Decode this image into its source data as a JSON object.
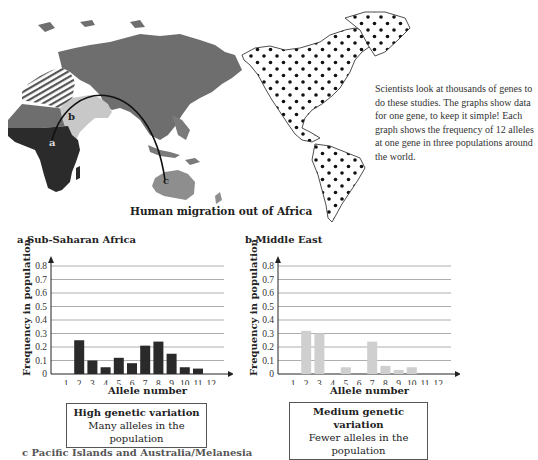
{
  "map": {
    "caption": "Human migration out of Africa",
    "labels": {
      "a": "a",
      "b": "b",
      "c": "c"
    },
    "colors": {
      "sub_saharan_africa": "#2b2b2b",
      "north_africa": "#6e6e6e",
      "middle_east": "#c8c8c8",
      "eurasia": "#6e6e6e",
      "australia": "#8e8e8e",
      "americas_fill": "#ffffff",
      "americas_dots": "#111111"
    }
  },
  "side_text": "Scientists look at thousands of genes to do these studies. The graphs show data for one gene, to keep it simple! Each graph shows the frequency of 12 alleles at one gene in three populations around the world.",
  "chart_data": [
    {
      "type": "bar",
      "title": "a Sub-Saharan Africa",
      "xlabel": "Allele number",
      "ylabel": "Frequency in population",
      "categories": [
        "1",
        "2",
        "3",
        "4",
        "5",
        "6",
        "7",
        "8",
        "9",
        "10",
        "11",
        "12"
      ],
      "values": [
        0,
        0.25,
        0.1,
        0.05,
        0.12,
        0.08,
        0.21,
        0.24,
        0.15,
        0.05,
        0.04,
        0
      ],
      "yticks": [
        "0",
        "0.1",
        "0.2",
        "0.3",
        "0.4",
        "0.5",
        "0.6",
        "0.7",
        "0.8"
      ],
      "ylim": [
        0,
        0.85
      ],
      "grid": true,
      "bar_color": "#2a2a2a"
    },
    {
      "type": "bar",
      "title": "b Middle East",
      "xlabel": "Allele number",
      "ylabel": "Frequency in population",
      "categories": [
        "1",
        "2",
        "3",
        "4",
        "5",
        "6",
        "7",
        "8",
        "9",
        "10",
        "11",
        "12"
      ],
      "values": [
        0,
        0.32,
        0.3,
        0,
        0.05,
        0,
        0.24,
        0.06,
        0.03,
        0.05,
        0,
        0
      ],
      "yticks": [
        "0",
        "0.1",
        "0.2",
        "0.3",
        "0.4",
        "0.5",
        "0.6",
        "0.7",
        "0.8"
      ],
      "ylim": [
        0,
        0.85
      ],
      "grid": true,
      "bar_color": "#cfcfcf"
    }
  ],
  "boxes": [
    {
      "heading": "High genetic variation",
      "text": "Many alleles in the population"
    },
    {
      "heading": "Medium genetic variation",
      "text": "Fewer alleles in the population"
    }
  ],
  "bottom_text": "c Pacific Islands and Australia/Melanesia"
}
